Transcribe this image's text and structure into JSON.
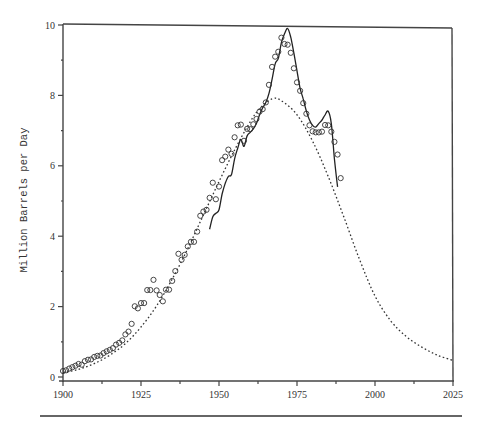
{
  "chart_data": {
    "type": "line",
    "title": "",
    "xlabel": "",
    "ylabel": "Million Barrels per Day",
    "xlim": [
      1900,
      2025
    ],
    "ylim": [
      0,
      10
    ],
    "x_ticks": [
      1900,
      1925,
      1950,
      1975,
      2000,
      2025
    ],
    "x_minor_ticks": [
      1912.5,
      1937.5,
      1962.5,
      1987.5,
      2012.5
    ],
    "y_ticks": [
      0,
      2,
      4,
      6,
      8,
      10
    ],
    "y_minor_ticks": [
      1,
      3,
      5,
      7,
      9
    ],
    "grid": false,
    "legend": null,
    "series": [
      {
        "name": "Annual production (observed)",
        "style": "open-circle markers",
        "x": [
          1900,
          1901,
          1902,
          1903,
          1904,
          1905,
          1906,
          1907,
          1908,
          1909,
          1910,
          1911,
          1912,
          1913,
          1914,
          1915,
          1916,
          1917,
          1918,
          1919,
          1920,
          1921,
          1922,
          1923,
          1924,
          1925,
          1926,
          1927,
          1928,
          1929,
          1930,
          1931,
          1932,
          1933,
          1934,
          1935,
          1936,
          1937,
          1938,
          1939,
          1940,
          1941,
          1942,
          1943,
          1944,
          1945,
          1946,
          1947,
          1948,
          1949,
          1950,
          1951,
          1952,
          1953,
          1954,
          1955,
          1956,
          1957,
          1958,
          1959,
          1960,
          1961,
          1962,
          1963,
          1964,
          1965,
          1966,
          1967,
          1968,
          1969,
          1970,
          1971,
          1972,
          1973,
          1974,
          1975,
          1976,
          1977,
          1978,
          1979,
          1980,
          1981,
          1982,
          1983,
          1984,
          1985,
          1986,
          1987,
          1988,
          1989
        ],
        "values": [
          0.17,
          0.19,
          0.24,
          0.28,
          0.32,
          0.37,
          0.35,
          0.45,
          0.49,
          0.5,
          0.57,
          0.6,
          0.61,
          0.68,
          0.73,
          0.77,
          0.82,
          0.92,
          0.97,
          1.04,
          1.21,
          1.29,
          1.51,
          2.01,
          1.95,
          2.1,
          2.1,
          2.47,
          2.47,
          2.76,
          2.46,
          2.33,
          2.15,
          2.48,
          2.48,
          2.73,
          3.01,
          3.5,
          3.33,
          3.47,
          3.71,
          3.84,
          3.84,
          4.13,
          4.58,
          4.7,
          4.75,
          5.09,
          5.52,
          5.05,
          5.41,
          6.16,
          6.26,
          6.46,
          6.34,
          6.81,
          7.15,
          7.17,
          6.71,
          7.05,
          7.04,
          7.18,
          7.33,
          7.54,
          7.61,
          7.8,
          8.3,
          8.81,
          9.1,
          9.24,
          9.64,
          9.46,
          9.44,
          9.21,
          8.77,
          8.37,
          8.13,
          7.78,
          7.48,
          7.15,
          6.98,
          6.95,
          6.95,
          6.97,
          7.16,
          7.15,
          6.97,
          6.68,
          6.32,
          5.65
        ]
      },
      {
        "name": "Hubbert model curve",
        "style": "dotted line",
        "x": [
          1900,
          1905,
          1910,
          1915,
          1920,
          1925,
          1930,
          1935,
          1940,
          1945,
          1950,
          1955,
          1960,
          1963,
          1967,
          1970,
          1975,
          1980,
          1985,
          1990,
          1995,
          2000,
          2005,
          2010,
          2015,
          2020,
          2025
        ],
        "values": [
          0.12,
          0.22,
          0.38,
          0.62,
          0.95,
          1.42,
          2.02,
          2.78,
          3.65,
          4.6,
          5.55,
          6.45,
          7.25,
          7.62,
          7.9,
          7.85,
          7.45,
          6.7,
          5.7,
          4.55,
          3.35,
          2.3,
          1.6,
          1.15,
          0.85,
          0.62,
          0.47
        ]
      },
      {
        "name": "Production incl. NGL (smoothed)",
        "style": "solid line",
        "x": [
          1947,
          1948,
          1949,
          1950,
          1951,
          1952,
          1953,
          1954,
          1955,
          1956,
          1957,
          1958,
          1959,
          1960,
          1961,
          1962,
          1963,
          1964,
          1965,
          1966,
          1967,
          1968,
          1969,
          1970,
          1971,
          1972,
          1973,
          1974,
          1975,
          1976,
          1977,
          1978,
          1979,
          1980,
          1981,
          1982,
          1983,
          1984,
          1985,
          1986,
          1987,
          1988
        ],
        "values": [
          4.2,
          4.55,
          4.65,
          4.75,
          5.2,
          5.5,
          5.7,
          5.75,
          6.2,
          6.5,
          6.75,
          6.55,
          6.85,
          6.95,
          7.05,
          7.2,
          7.45,
          7.65,
          7.8,
          8.05,
          8.45,
          8.9,
          9.05,
          9.5,
          9.75,
          9.9,
          9.65,
          9.2,
          8.7,
          8.2,
          7.9,
          7.55,
          7.3,
          7.15,
          7.1,
          7.2,
          7.3,
          7.45,
          7.55,
          7.2,
          6.2,
          5.4
        ]
      }
    ]
  },
  "axes": {
    "y_axis_label": "Million Barrels per Day",
    "x_tick_labels": [
      "1900",
      "1925",
      "1950",
      "1975",
      "2000",
      "2025"
    ],
    "y_tick_labels": [
      "0",
      "2",
      "4",
      "6",
      "8",
      "10"
    ]
  }
}
